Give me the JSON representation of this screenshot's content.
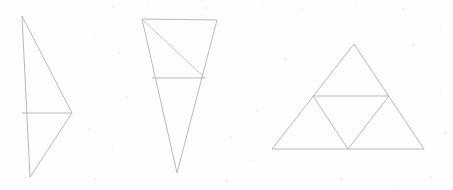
{
  "page": {
    "width": 453,
    "height": 190,
    "background_color": "#fefefe",
    "stroke_color": "#a8a8a8",
    "stroke_width": 0.8,
    "speck_color": "#e9e9e9"
  },
  "figures": [
    {
      "id": "figure-1",
      "name": "right-pointing-triangle-with-midline",
      "description": "Tall narrow triangle pointing to the right with a near-vertical left edge and a horizontal median segment",
      "vertices": {
        "top": [
          22,
          16
        ],
        "bottom": [
          30,
          177
        ],
        "right": [
          72,
          113
        ]
      },
      "outline_points": "22,16 72,113 30,177",
      "internal_segments": [
        {
          "name": "horizontal-median",
          "from": [
            22,
            113
          ],
          "to": [
            72,
            113
          ]
        }
      ]
    },
    {
      "id": "figure-2",
      "name": "inverted-triangle-with-crossline-and-diagonal",
      "description": "Downward-pointing triangle subdivided by a horizontal crossline and a diagonal from the top-left vertex",
      "vertices": {
        "top_left": [
          142,
          19
        ],
        "top_right": [
          217,
          20
        ],
        "apex": [
          177,
          173
        ]
      },
      "outline_points": "142,19 217,20 177,173",
      "internal_segments": [
        {
          "name": "horizontal-crossline",
          "from": [
            152,
            78
          ],
          "to": [
            205,
            78
          ]
        },
        {
          "name": "diagonal",
          "from": [
            143,
            20
          ],
          "to": [
            205,
            78
          ]
        }
      ]
    },
    {
      "id": "figure-3",
      "name": "sierpinski-triangle-stage-one",
      "description": "Equilateral triangle with the three edge midpoints joined, forming four smaller congruent triangles",
      "vertices": {
        "apex": [
          354,
          44
        ],
        "bottom_left": [
          272,
          149
        ],
        "bottom_right": [
          424,
          149
        ]
      },
      "outline_points": "354,44 424,149 272,149",
      "midpoints": {
        "left_edge": [
          313,
          96
        ],
        "right_edge": [
          389,
          96
        ],
        "bottom_edge": [
          348,
          149
        ]
      },
      "internal_segments": [
        {
          "name": "midline-horizontal",
          "from": [
            313,
            96
          ],
          "to": [
            389,
            96
          ]
        },
        {
          "name": "midline-left",
          "from": [
            313,
            96
          ],
          "to": [
            348,
            149
          ]
        },
        {
          "name": "midline-right",
          "from": [
            389,
            96
          ],
          "to": [
            348,
            149
          ]
        }
      ]
    }
  ],
  "background_specks": [
    {
      "x": 112,
      "y": 6,
      "size": 2
    },
    {
      "x": 148,
      "y": 4,
      "size": 1
    },
    {
      "x": 205,
      "y": 7,
      "size": 2
    },
    {
      "x": 262,
      "y": 5,
      "size": 1
    },
    {
      "x": 300,
      "y": 9,
      "size": 2
    },
    {
      "x": 356,
      "y": 3,
      "size": 1
    },
    {
      "x": 402,
      "y": 8,
      "size": 2
    },
    {
      "x": 436,
      "y": 6,
      "size": 1
    },
    {
      "x": 94,
      "y": 34,
      "size": 1
    },
    {
      "x": 118,
      "y": 52,
      "size": 2
    },
    {
      "x": 246,
      "y": 40,
      "size": 1
    },
    {
      "x": 284,
      "y": 58,
      "size": 2
    },
    {
      "x": 318,
      "y": 25,
      "size": 1
    },
    {
      "x": 412,
      "y": 44,
      "size": 2
    },
    {
      "x": 440,
      "y": 30,
      "size": 1
    },
    {
      "x": 100,
      "y": 78,
      "size": 1
    },
    {
      "x": 126,
      "y": 96,
      "size": 2
    },
    {
      "x": 238,
      "y": 86,
      "size": 1
    },
    {
      "x": 256,
      "y": 110,
      "size": 2
    },
    {
      "x": 440,
      "y": 92,
      "size": 1
    },
    {
      "x": 88,
      "y": 128,
      "size": 2
    },
    {
      "x": 112,
      "y": 150,
      "size": 1
    },
    {
      "x": 230,
      "y": 136,
      "size": 2
    },
    {
      "x": 250,
      "y": 160,
      "size": 1
    },
    {
      "x": 444,
      "y": 132,
      "size": 2
    },
    {
      "x": 30,
      "y": 182,
      "size": 1
    },
    {
      "x": 94,
      "y": 178,
      "size": 2
    },
    {
      "x": 160,
      "y": 184,
      "size": 1
    },
    {
      "x": 226,
      "y": 180,
      "size": 2
    },
    {
      "x": 292,
      "y": 186,
      "size": 1
    },
    {
      "x": 340,
      "y": 178,
      "size": 2
    },
    {
      "x": 398,
      "y": 184,
      "size": 1
    },
    {
      "x": 430,
      "y": 176,
      "size": 2
    }
  ]
}
